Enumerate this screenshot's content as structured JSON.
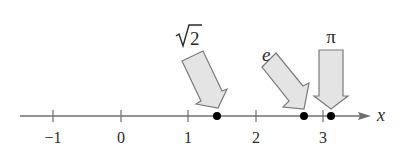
{
  "diagram": {
    "type": "number-line",
    "axis": {
      "label": "x",
      "range": [
        -1.5,
        3.7
      ],
      "ticks": [
        {
          "value": -1,
          "label": "−1"
        },
        {
          "value": 0,
          "label": "0"
        },
        {
          "value": 1,
          "label": "1"
        },
        {
          "value": 2,
          "label": "2"
        },
        {
          "value": 3,
          "label": "3"
        }
      ]
    },
    "points": [
      {
        "name": "sqrt2",
        "label": "√2",
        "radicand": "2",
        "value": 1.414
      },
      {
        "name": "e",
        "label": "e",
        "value": 2.718
      },
      {
        "name": "pi",
        "label": "π",
        "value": 3.1416
      }
    ],
    "colors": {
      "axis": "#6e6e6e",
      "arrow_fill": "#e4e4e4",
      "arrow_stroke": "#7a7a7a",
      "point": "#000000",
      "text": "#2a2a2a"
    }
  }
}
